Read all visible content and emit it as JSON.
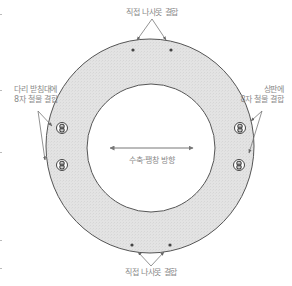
{
  "diagram": {
    "title": "",
    "colors": {
      "ring_fill": "#e2e2e2",
      "ring_stroke": "#555555",
      "arrow": "#777777",
      "label_text": "#8a8a8a",
      "fastener": "#444444"
    },
    "labels": {
      "top": "직접 나사못 결합",
      "bottom": "직접 나사못 결합",
      "left_line1": "다리 받침대에",
      "left_line2": "8자 철물 결합",
      "right_line1": "상판에",
      "right_line2": "8자 철물 결합",
      "center": "수축·팽창 방향"
    },
    "elements": {
      "ring": {
        "cx": 150,
        "cy": 146,
        "rx": 104,
        "ry": 107
      },
      "inner_hole": {
        "cx": 151,
        "cy": 148,
        "r": 64
      },
      "screws_top": [
        {
          "x": 133,
          "y": 50
        },
        {
          "x": 171,
          "y": 50
        }
      ],
      "screws_bottom": [
        {
          "x": 132,
          "y": 245
        },
        {
          "x": 170,
          "y": 245
        }
      ],
      "figure8_left": [
        {
          "x": 62,
          "y": 128
        },
        {
          "x": 62,
          "y": 165
        }
      ],
      "figure8_right": [
        {
          "x": 240,
          "y": 128
        },
        {
          "x": 239,
          "y": 165
        }
      ],
      "center_arrow": {
        "x1": 110,
        "x2": 193,
        "y": 148,
        "direction": "bidirectional-horizontal"
      }
    }
  }
}
